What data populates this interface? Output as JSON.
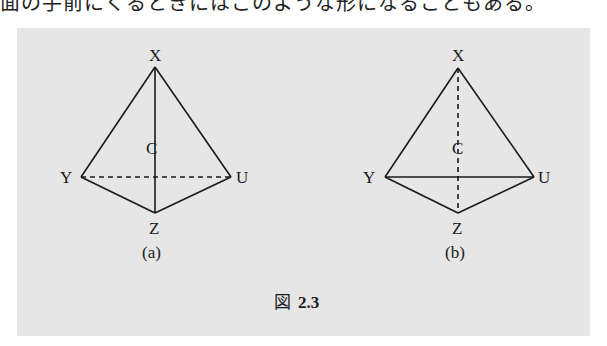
{
  "top_text": "面の手前にくるときにはこのような形になることもある。",
  "figure": {
    "background": "#e6e6e6",
    "line_color": "#1a1a1a",
    "caption_prefix": "図",
    "caption_number": "2.3",
    "diagrams": [
      {
        "id": "a",
        "label": "(a)",
        "vertices": {
          "X": {
            "label": "X",
            "x": 155,
            "y": 67
          },
          "Y": {
            "label": "Y",
            "x": 81,
            "y": 177
          },
          "U": {
            "label": "U",
            "x": 231,
            "y": 177
          },
          "Z": {
            "label": "Z",
            "x": 155,
            "y": 213
          },
          "C": {
            "label": "C"
          }
        },
        "edges_solid": [
          "X-Y",
          "X-U",
          "Y-Z",
          "U-Z",
          "X-Z"
        ],
        "edges_dashed": [
          "Y-U"
        ]
      },
      {
        "id": "b",
        "label": "(b)",
        "vertices": {
          "X": {
            "label": "X",
            "x": 458,
            "y": 68
          },
          "Y": {
            "label": "Y",
            "x": 385,
            "y": 177
          },
          "U": {
            "label": "U",
            "x": 534,
            "y": 177
          },
          "Z": {
            "label": "Z",
            "x": 458,
            "y": 213
          },
          "C": {
            "label": "C"
          }
        },
        "edges_solid": [
          "X-Y",
          "X-U",
          "Y-Z",
          "U-Z",
          "Y-U"
        ],
        "edges_dashed": [
          "X-Z"
        ]
      }
    ]
  }
}
